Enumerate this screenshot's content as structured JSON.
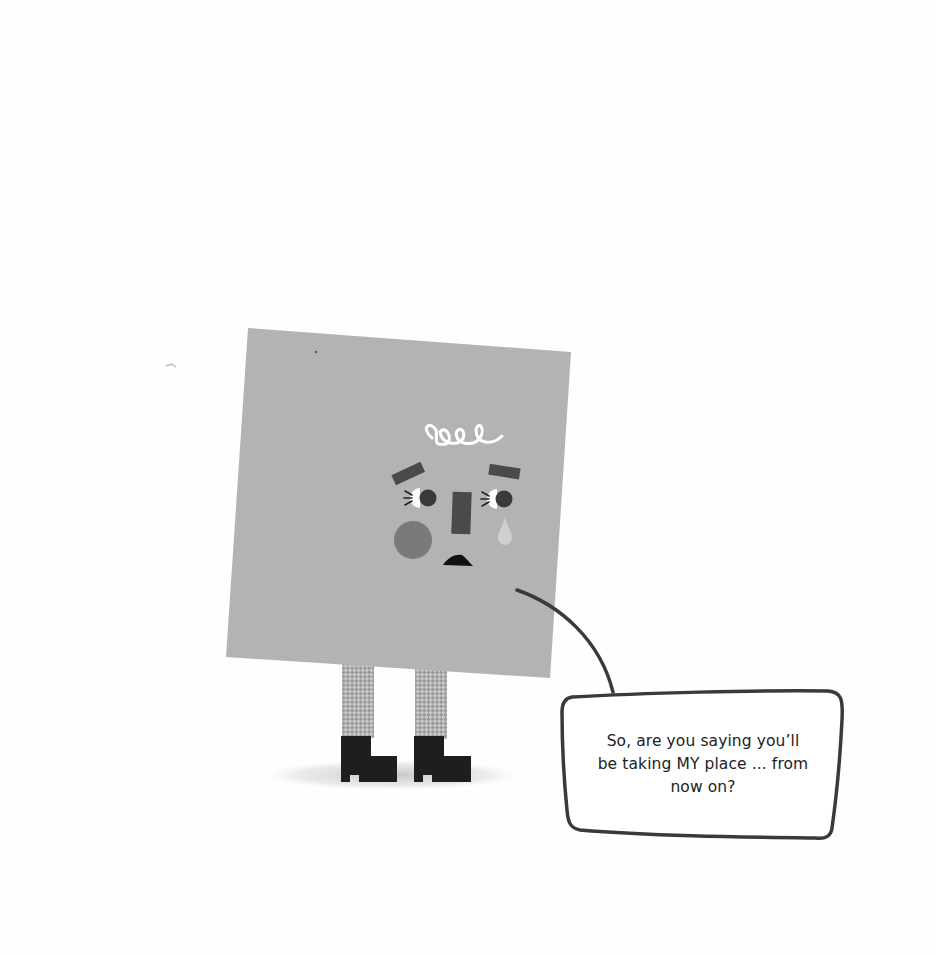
{
  "page": {
    "background": "#fefefe"
  },
  "character": {
    "name": "square",
    "body_color": "#b3b3b3",
    "feature_color": "#4a4a4a",
    "cheek_color": "#7a7a7a",
    "tear_color": "#cfcfcf",
    "boot_color": "#1e1e1e",
    "expression": "sad-crying"
  },
  "speech_bubble": {
    "lines": [
      "So, are you saying you’ll",
      "be taking MY place ... from",
      "now on?"
    ],
    "border_color": "#3a3a3a"
  }
}
